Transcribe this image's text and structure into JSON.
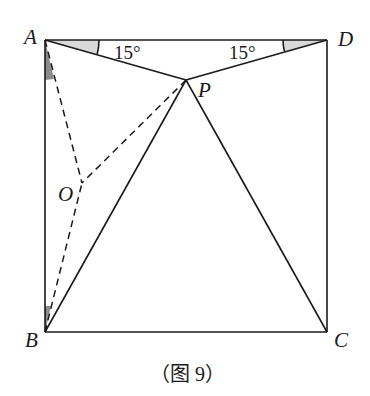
{
  "figure": {
    "caption": "（图 9）",
    "points": {
      "A": {
        "label": "A",
        "x": 45,
        "y": 40
      },
      "B": {
        "label": "B",
        "x": 45,
        "y": 332
      },
      "C": {
        "label": "C",
        "x": 327,
        "y": 332
      },
      "D": {
        "label": "D",
        "x": 327,
        "y": 40
      },
      "P": {
        "label": "P",
        "x": 186,
        "y": 80
      },
      "O": {
        "label": "O",
        "x": 82,
        "y": 183
      }
    },
    "angles": {
      "DAP": {
        "label": "15°"
      },
      "ADP": {
        "label": "15°"
      }
    },
    "segments_solid": [
      "AB",
      "BC",
      "CD",
      "DA",
      "AP",
      "DP",
      "BP",
      "CP"
    ],
    "segments_dashed": [
      "AO",
      "BO",
      "PO"
    ],
    "colors": {
      "stroke": "#1a1a1a",
      "light_shade": "#d9d9d9",
      "dark_shade": "#8c8c8c",
      "background": "#ffffff"
    }
  }
}
